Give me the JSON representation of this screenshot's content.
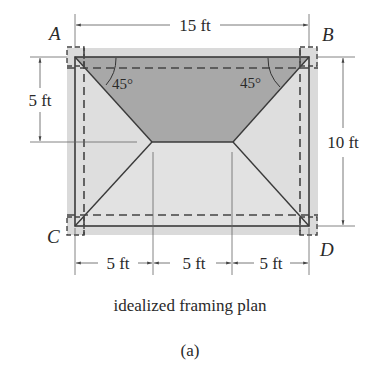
{
  "figure": {
    "caption": "idealized framing plan",
    "sublabel": "(a)"
  },
  "corners": {
    "A": "A",
    "B": "B",
    "C": "C",
    "D": "D"
  },
  "dimensions": {
    "top_width": "15 ft",
    "left_height": "5 ft",
    "right_height": "10 ft",
    "bottom_segments": [
      "5 ft",
      "5 ft",
      "5 ft"
    ]
  },
  "angles": {
    "left": "45°",
    "right": "45°"
  },
  "colors": {
    "outer_fill": "#d9d9d9",
    "light_panel": "#dcdcdc",
    "dark_panel": "#a9a9a9",
    "line": "#3a3a3a",
    "dim_line": "#555555"
  }
}
